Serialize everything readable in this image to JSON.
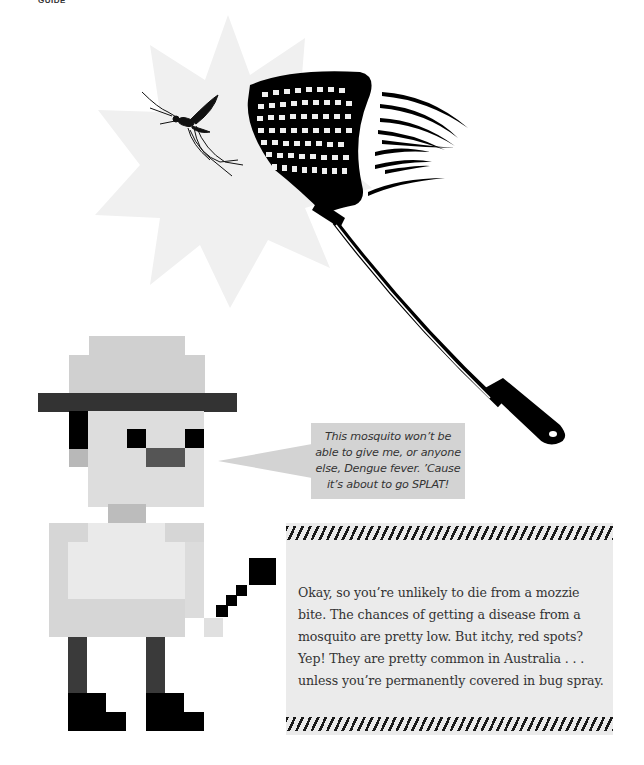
{
  "page": {
    "header_label": "GUIDE"
  },
  "illustration": {
    "background_shape": "starburst",
    "subjects": [
      "mosquito",
      "fly-swatter",
      "motion-lines"
    ],
    "starburst_color": "#f0f0f0",
    "swatter_color": "#000000"
  },
  "character": {
    "description": "pixel-art man in wide-brim hat holding a fly swatter",
    "colors": {
      "hat": "#d0d0d0",
      "brim": "#333333",
      "skin": "#dddddd",
      "eyes": "#000000",
      "mouth": "#555555",
      "neck": "#bcbcbc",
      "shirt": "#eaeaea",
      "shirt_side": "#d6d6d6",
      "legs": "#3a3a3a",
      "boots": "#000000"
    }
  },
  "speech_bubble": {
    "text": "This mosquito won’t be able to give me, or anyone else, Dengue fever. ’Cause it’s about to go SPLAT!",
    "color": "#d3d3d3"
  },
  "info_box": {
    "text": "Okay, so you’re unlikely to die from a mozzie bite. The chances of getting a disease from a mosquito are pretty low. But itchy, red spots? Yep! They are pretty common in Australia . . . unless you’re permanently covered in bug spray.",
    "background": "#ebebeb",
    "stripe_color": "#1a1a1a"
  }
}
